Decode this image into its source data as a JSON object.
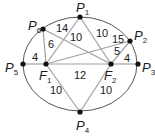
{
  "diagram": {
    "type": "ellipse-with-foci",
    "ellipse": {
      "cx": 80,
      "cy": 64,
      "rx": 57,
      "ry": 47,
      "stroke": "#555555"
    },
    "edge_color": "#a0a0a0",
    "points": [
      {
        "id": "P1",
        "letter": "P",
        "sub": "1",
        "x": 80,
        "y": 17,
        "lx": 76,
        "ly": 12
      },
      {
        "id": "P2",
        "letter": "P",
        "sub": "2",
        "x": 130,
        "y": 41,
        "lx": 134,
        "ly": 40
      },
      {
        "id": "P3",
        "letter": "P",
        "sub": "3",
        "x": 138,
        "y": 64,
        "lx": 142,
        "ly": 72
      },
      {
        "id": "P4",
        "letter": "P",
        "sub": "4",
        "x": 80,
        "y": 112,
        "lx": 76,
        "ly": 130
      },
      {
        "id": "P5",
        "letter": "P",
        "sub": "5",
        "x": 23,
        "y": 64,
        "lx": 5,
        "ly": 72
      },
      {
        "id": "P6",
        "letter": "P",
        "sub": "6",
        "x": 43,
        "y": 29,
        "lx": 28,
        "ly": 30
      },
      {
        "id": "F1",
        "letter": "F",
        "sub": "1",
        "x": 46,
        "y": 64,
        "lx": 39,
        "ly": 80
      },
      {
        "id": "F2",
        "letter": "F",
        "sub": "2",
        "x": 111,
        "y": 64,
        "lx": 104,
        "ly": 80
      }
    ],
    "edges": [
      {
        "from": "P5",
        "to": "F1",
        "label": "4",
        "lx": 32,
        "ly": 61
      },
      {
        "from": "F1",
        "to": "F2",
        "label": "12",
        "lx": 74,
        "ly": 79
      },
      {
        "from": "F2",
        "to": "P3",
        "label": "4",
        "lx": 124,
        "ly": 62
      },
      {
        "from": "P6",
        "to": "F1",
        "label": "6",
        "lx": 48,
        "ly": 48
      },
      {
        "from": "P6",
        "to": "F2",
        "label": "14",
        "lx": 56,
        "ly": 32
      },
      {
        "from": "P1",
        "to": "F1",
        "label": "10",
        "lx": 70,
        "ly": 41
      },
      {
        "from": "P1",
        "to": "F2",
        "label": "10",
        "lx": 96,
        "ly": 37
      },
      {
        "from": "P2",
        "to": "F1",
        "label": "15",
        "lx": 112,
        "ly": 43
      },
      {
        "from": "P2",
        "to": "F2",
        "label": "5",
        "lx": 114,
        "ly": 55
      },
      {
        "from": "P4",
        "to": "F1",
        "label": "10",
        "lx": 50,
        "ly": 94
      },
      {
        "from": "P4",
        "to": "F2",
        "label": "10",
        "lx": 100,
        "ly": 94
      }
    ]
  }
}
